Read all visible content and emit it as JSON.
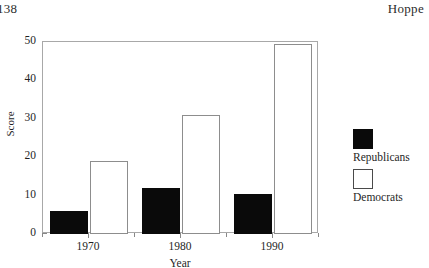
{
  "page": {
    "number": "138",
    "author": "Hoppe"
  },
  "chart_data": {
    "type": "bar",
    "title": "",
    "xlabel": "Year",
    "ylabel": "Score",
    "categories": [
      "1970",
      "1980",
      "1990"
    ],
    "series": [
      {
        "name": "Republicans",
        "color": "#0a0a0a",
        "fill": "solid",
        "values": [
          6,
          12,
          10.5
        ]
      },
      {
        "name": "Democrats",
        "color": "#ffffff",
        "fill": "hollow",
        "values": [
          19,
          31,
          49.5
        ]
      }
    ],
    "ylim": [
      0,
      50
    ],
    "y_ticks": [
      0,
      10,
      20,
      30,
      40,
      50
    ],
    "y_tick_labels": [
      "0",
      "10",
      "20",
      "30",
      "40",
      "50"
    ],
    "y_minor_ticks": [
      5,
      15,
      25,
      35,
      45
    ],
    "grid": false,
    "legend_position": "right",
    "frame": "box"
  }
}
